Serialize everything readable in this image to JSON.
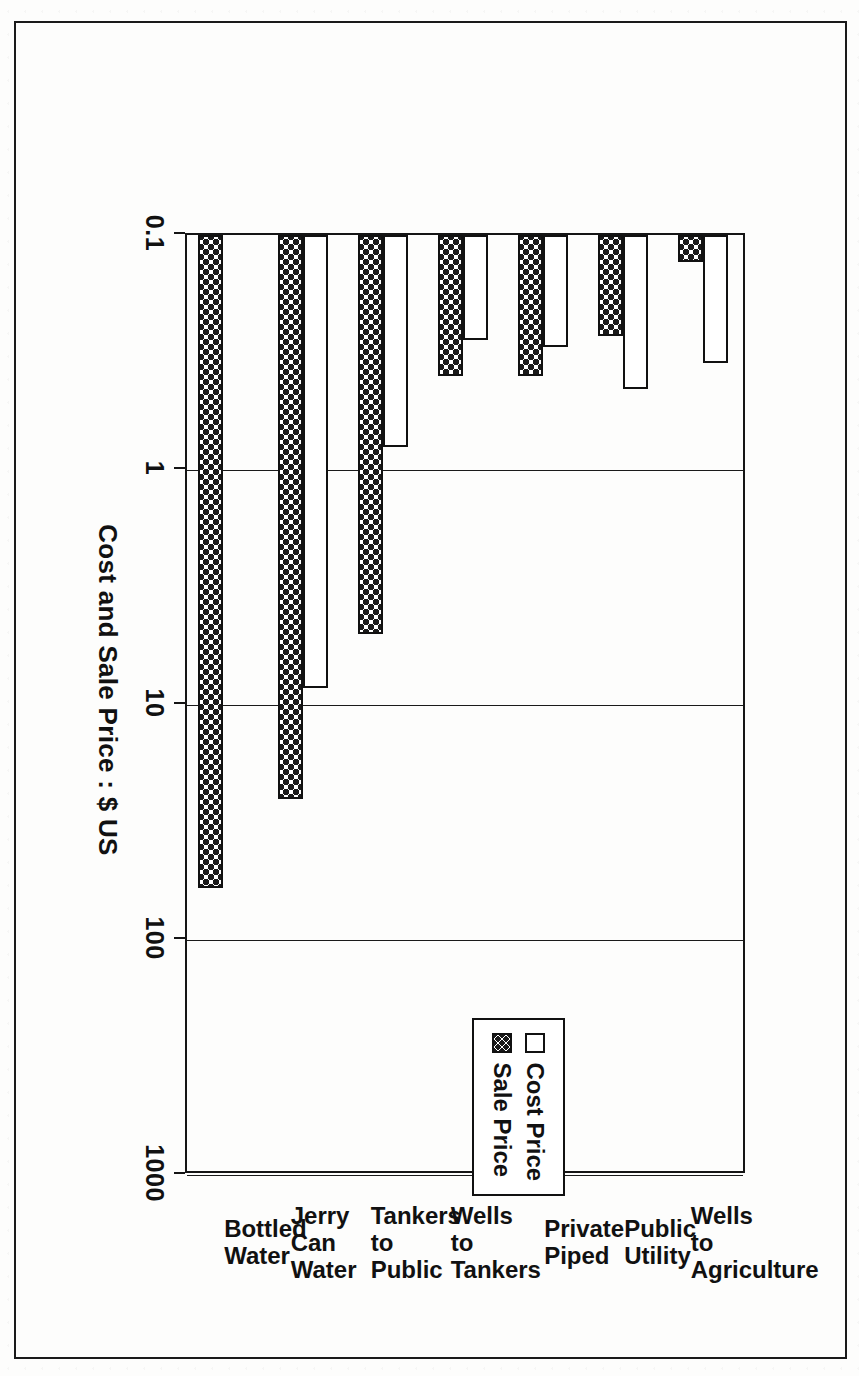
{
  "chart_data": {
    "type": "bar",
    "orientation": "horizontal-scan-rotated",
    "title": "",
    "xlabel": "",
    "ylabel": "Cost and Sale Price : $ US",
    "axis_title": "Cost and Sale Price : $ US",
    "scale": "log",
    "ylim": [
      0.1,
      1000
    ],
    "tick_labels": [
      "0.1",
      "1",
      "10",
      "100",
      "1000"
    ],
    "tick_values": [
      0.1,
      1,
      10,
      100,
      1000
    ],
    "grid": true,
    "legend_position": "inside-left",
    "categories": [
      "Wells to\nAgriculture",
      "Public Utility",
      "Private Piped",
      "Wells to Tankers",
      "Tankers to\nPublic",
      "Jerry Can Water",
      "Bottled Water"
    ],
    "series": [
      {
        "name": "Cost Price",
        "style": "open",
        "values": [
          0.35,
          0.45,
          0.3,
          0.28,
          0.8,
          8.5,
          null
        ]
      },
      {
        "name": "Sale Price",
        "style": "dotted",
        "values": [
          0.13,
          0.27,
          0.4,
          0.4,
          5.0,
          25.0,
          60.0
        ]
      }
    ]
  },
  "legend": {
    "items": [
      {
        "label": "Cost Price",
        "swatch": "open-square"
      },
      {
        "label": "Sale Price",
        "swatch": "dotted-square"
      }
    ]
  },
  "axis": {
    "title": "Cost and Sale Price : $ US",
    "ticks": [
      "0.1",
      "1",
      "10",
      "100",
      "1000"
    ]
  },
  "categories": [
    {
      "label": "Wells to\nAgriculture"
    },
    {
      "label": "Public Utility"
    },
    {
      "label": "Private Piped"
    },
    {
      "label": "Wells to Tankers"
    },
    {
      "label": "Tankers to\nPublic"
    },
    {
      "label": "Jerry Can Water"
    },
    {
      "label": "Bottled Water"
    }
  ],
  "colors": {
    "ink": "#151515",
    "paper": "#fdfdfc"
  }
}
